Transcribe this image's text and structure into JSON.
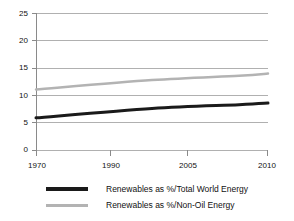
{
  "chart_data": {
    "type": "line",
    "title": "",
    "subtitle": "",
    "xlabel": "",
    "ylabel": "",
    "x": [
      1970,
      1990,
      2005,
      2010
    ],
    "xlim": [
      1970,
      2010
    ],
    "ylim": [
      0,
      25
    ],
    "grid": true,
    "grid_axis": "y",
    "legend_position": "bottom",
    "xtick_labels": [
      "1970",
      "1990",
      "2005",
      "2010"
    ],
    "ytick_labels": [
      "0",
      "5",
      "10",
      "15",
      "20",
      "25"
    ],
    "ytick_values": [
      0,
      5,
      10,
      15,
      20,
      25
    ],
    "series": [
      {
        "name": "Renewables as %/Total World Energy",
        "color": "#1a1a1a",
        "width": 3,
        "values": [
          5.9,
          7.6,
          8.3,
          8.6
        ]
      },
      {
        "name": "Renewables as %/Non-Oil Energy",
        "color": "#b3b3b3",
        "width": 2.5,
        "values": [
          11.1,
          12.8,
          13.6,
          14.0
        ]
      }
    ]
  },
  "axes": {
    "y_labels": [
      "25",
      "20",
      "15",
      "10",
      "5",
      "0"
    ],
    "x_labels": [
      "1970",
      "1990",
      "2005",
      "2010"
    ]
  },
  "legend": {
    "items": [
      {
        "label": "Renewables as %/Total World Energy",
        "color": "#1a1a1a"
      },
      {
        "label": "Renewables as %/Non-Oil Energy",
        "color": "#b3b3b3"
      }
    ]
  },
  "colors": {
    "background": "#ffffff",
    "grid": "#b0b0b0",
    "axis": "#8a8a8a",
    "text": "#111111",
    "series_total_world": "#1a1a1a",
    "series_non_oil": "#b3b3b3"
  }
}
